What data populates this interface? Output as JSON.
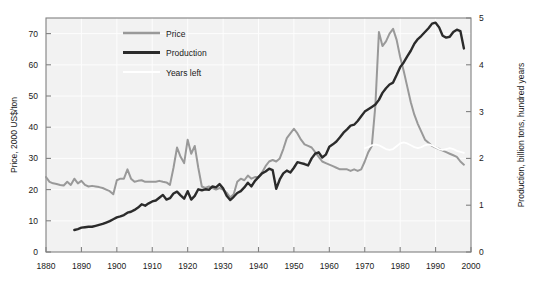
{
  "chart_data": {
    "type": "line",
    "title": "",
    "xlabel": "",
    "ylabel": "Price, 2000 US$/ton",
    "y2label": "Production, billion tons, hundred years",
    "xlim": [
      1880,
      2000
    ],
    "ylim": [
      0,
      75
    ],
    "y2lim": [
      0,
      5
    ],
    "grid": true,
    "legend_position": "top-left-inside",
    "xticks": [
      1880,
      1890,
      1900,
      1910,
      1920,
      1930,
      1940,
      1950,
      1960,
      1970,
      1980,
      1990,
      2000
    ],
    "xtick_labels": [
      "1880",
      "1890",
      "1900",
      "1910",
      "1920",
      "1930",
      "1940",
      "1950",
      "1960",
      "1970",
      "1980",
      "1990",
      "2000"
    ],
    "yticks": [
      0,
      10,
      20,
      30,
      40,
      50,
      60,
      70
    ],
    "ytick_labels": [
      "0",
      "10",
      "20",
      "30",
      "40",
      "50",
      "60",
      "70"
    ],
    "y2ticks": [
      0,
      1,
      2,
      3,
      4,
      5
    ],
    "y2tick_labels": [
      "0",
      "1",
      "2",
      "3",
      "4",
      "5"
    ],
    "series": [
      {
        "name": "Price",
        "axis": "left",
        "color": "#999999",
        "width": 2.0,
        "units": "2000 US$/ton",
        "x": [
          1880,
          1881,
          1882,
          1883,
          1884,
          1885,
          1886,
          1887,
          1888,
          1889,
          1890,
          1891,
          1892,
          1893,
          1894,
          1895,
          1896,
          1897,
          1898,
          1899,
          1900,
          1901,
          1902,
          1903,
          1904,
          1905,
          1906,
          1907,
          1908,
          1909,
          1910,
          1911,
          1912,
          1913,
          1914,
          1915,
          1916,
          1917,
          1918,
          1919,
          1920,
          1921,
          1922,
          1923,
          1924,
          1925,
          1926,
          1927,
          1928,
          1929,
          1930,
          1931,
          1932,
          1933,
          1934,
          1935,
          1936,
          1937,
          1938,
          1939,
          1940,
          1941,
          1942,
          1943,
          1944,
          1945,
          1946,
          1947,
          1948,
          1949,
          1950,
          1951,
          1952,
          1953,
          1954,
          1955,
          1956,
          1957,
          1958,
          1959,
          1960,
          1961,
          1962,
          1963,
          1964,
          1965,
          1966,
          1967,
          1968,
          1969,
          1970,
          1971,
          1972,
          1973,
          1974,
          1975,
          1976,
          1977,
          1978,
          1979,
          1980,
          1981,
          1982,
          1983,
          1984,
          1985,
          1986,
          1987,
          1988,
          1989,
          1990,
          1991,
          1992,
          1993,
          1994,
          1995,
          1996,
          1997,
          1998
        ],
        "values": [
          24.0,
          22.5,
          22.0,
          21.8,
          21.5,
          21.3,
          22.5,
          21.5,
          23.5,
          22.0,
          22.8,
          21.5,
          21.0,
          21.2,
          21.0,
          20.8,
          20.5,
          20.0,
          19.5,
          18.5,
          23.0,
          23.5,
          23.5,
          26.5,
          23.5,
          22.5,
          22.8,
          23.0,
          22.5,
          22.5,
          22.5,
          22.5,
          22.8,
          22.5,
          22.3,
          21.5,
          27.0,
          33.5,
          30.5,
          28.5,
          36.0,
          31.5,
          34.0,
          27.0,
          21.0,
          20.5,
          21.0,
          20.5,
          20.0,
          20.5,
          20.0,
          19.0,
          17.5,
          18.5,
          22.5,
          23.5,
          23.0,
          24.5,
          23.5,
          24.0,
          24.0,
          25.5,
          27.5,
          29.0,
          29.5,
          29.0,
          30.0,
          33.0,
          36.5,
          38.0,
          39.5,
          38.0,
          36.0,
          34.5,
          34.0,
          33.5,
          32.0,
          30.5,
          29.0,
          28.5,
          28.0,
          27.5,
          27.0,
          26.5,
          26.5,
          26.5,
          26.0,
          26.5,
          26.0,
          26.5,
          29.0,
          32.0,
          34.0,
          47.0,
          70.5,
          66.0,
          67.5,
          70.0,
          71.5,
          68.0,
          62.5,
          58.0,
          53.0,
          48.0,
          44.0,
          41.0,
          38.5,
          36.0,
          35.0,
          34.0,
          33.5,
          33.0,
          32.5,
          32.0,
          31.5,
          31.0,
          30.5,
          29.0,
          28.0
        ]
      },
      {
        "name": "Production",
        "axis": "right",
        "color": "#2b2b2b",
        "width": 2.4,
        "units": "billion tons",
        "x": [
          1888,
          1889,
          1890,
          1891,
          1892,
          1893,
          1894,
          1895,
          1896,
          1897,
          1898,
          1899,
          1900,
          1901,
          1902,
          1903,
          1904,
          1905,
          1906,
          1907,
          1908,
          1909,
          1910,
          1911,
          1912,
          1913,
          1914,
          1915,
          1916,
          1917,
          1918,
          1919,
          1920,
          1921,
          1922,
          1923,
          1924,
          1925,
          1926,
          1927,
          1928,
          1929,
          1930,
          1931,
          1932,
          1933,
          1934,
          1935,
          1936,
          1937,
          1938,
          1939,
          1940,
          1941,
          1942,
          1943,
          1944,
          1945,
          1946,
          1947,
          1948,
          1949,
          1950,
          1951,
          1952,
          1953,
          1954,
          1955,
          1956,
          1957,
          1958,
          1959,
          1960,
          1961,
          1962,
          1963,
          1964,
          1965,
          1966,
          1967,
          1968,
          1969,
          1970,
          1971,
          1972,
          1973,
          1974,
          1975,
          1976,
          1977,
          1978,
          1979,
          1980,
          1981,
          1982,
          1983,
          1984,
          1985,
          1986,
          1987,
          1988,
          1989,
          1990,
          1991,
          1992,
          1993,
          1994,
          1995,
          1996,
          1997,
          1998
        ],
        "values": [
          0.47,
          0.49,
          0.52,
          0.53,
          0.54,
          0.54,
          0.56,
          0.58,
          0.6,
          0.63,
          0.66,
          0.7,
          0.74,
          0.76,
          0.79,
          0.84,
          0.86,
          0.9,
          0.95,
          1.02,
          0.99,
          1.04,
          1.08,
          1.1,
          1.16,
          1.22,
          1.12,
          1.15,
          1.25,
          1.29,
          1.21,
          1.14,
          1.3,
          1.12,
          1.2,
          1.34,
          1.32,
          1.34,
          1.33,
          1.4,
          1.38,
          1.45,
          1.36,
          1.2,
          1.11,
          1.18,
          1.26,
          1.3,
          1.38,
          1.48,
          1.4,
          1.52,
          1.6,
          1.68,
          1.72,
          1.78,
          1.75,
          1.35,
          1.55,
          1.68,
          1.74,
          1.7,
          1.8,
          1.92,
          1.9,
          1.88,
          1.85,
          2.0,
          2.1,
          2.13,
          2.02,
          2.08,
          2.25,
          2.3,
          2.36,
          2.45,
          2.55,
          2.62,
          2.7,
          2.72,
          2.8,
          2.9,
          3.0,
          3.05,
          3.1,
          3.15,
          3.25,
          3.4,
          3.5,
          3.58,
          3.62,
          3.78,
          3.95,
          4.05,
          4.18,
          4.3,
          4.45,
          4.55,
          4.62,
          4.7,
          4.78,
          4.88,
          4.9,
          4.8,
          4.62,
          4.58,
          4.6,
          4.7,
          4.75,
          4.72,
          4.35
        ]
      },
      {
        "name": "Years left",
        "axis": "right",
        "color": "#ffffff",
        "width": 1.8,
        "units": "hundred years",
        "x": [
          1970,
          1971,
          1972,
          1973,
          1974,
          1975,
          1976,
          1977,
          1978,
          1979,
          1980,
          1981,
          1982,
          1983,
          1984,
          1985,
          1986,
          1987,
          1988,
          1989,
          1990,
          1991,
          1992,
          1993,
          1994,
          1995,
          1996,
          1997,
          1998
        ],
        "values": [
          2.22,
          2.24,
          2.28,
          2.3,
          2.28,
          2.24,
          2.2,
          2.18,
          2.2,
          2.26,
          2.32,
          2.34,
          2.32,
          2.28,
          2.24,
          2.22,
          2.24,
          2.28,
          2.3,
          2.28,
          2.24,
          2.2,
          2.18,
          2.2,
          2.22,
          2.2,
          2.16,
          2.14,
          2.12
        ]
      }
    ],
    "annotations": [
      "WWI price spike 1917-1922 peaking near 36",
      "Post-WWII price peak near 39.5 around 1950",
      "1970s oil-crisis price peak near 71.5 in 1978-1979",
      "Production peak near 4.9 around 1989"
    ]
  },
  "axes": {
    "left_title": "Price, 2000 US$/ton",
    "right_title": "Production, billion tons, hundred years"
  },
  "legend": {
    "items": [
      {
        "label": "Price",
        "color": "#999999"
      },
      {
        "label": "Production",
        "color": "#2b2b2b"
      },
      {
        "label": "Years left",
        "color": "#ffffff"
      }
    ]
  },
  "colors": {
    "plot_background": "#f2f2f2",
    "grid": "#fdfdfd",
    "frame": "#808080",
    "text": "#1a1a1a",
    "price": "#999999",
    "production": "#2b2b2b",
    "years_left": "#ffffff"
  }
}
